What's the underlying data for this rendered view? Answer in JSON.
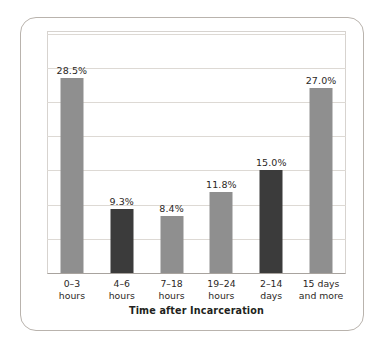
{
  "chart_data": {
    "type": "bar",
    "title": "",
    "xlabel": "Time after Incarceration",
    "ylabel": "Percentage of Inmate Suicides",
    "categories": [
      "0–3 hours",
      "4–6 hours",
      "7–18 hours",
      "19–24 hours",
      "2–14 days",
      "15 days and more"
    ],
    "category_lines": [
      {
        "line1": "0–3",
        "line2": "hours"
      },
      {
        "line1": "4–6",
        "line2": "hours"
      },
      {
        "line1": "7–18",
        "line2": "hours"
      },
      {
        "line1": "19–24",
        "line2": "hours"
      },
      {
        "line1": "2–14",
        "line2": "days"
      },
      {
        "line1": "15 days",
        "line2": "and more"
      }
    ],
    "values": [
      28.5,
      9.3,
      8.4,
      11.8,
      15.0,
      27.0
    ],
    "value_labels": [
      "28.5%",
      "9.3%",
      "8.4%",
      "11.8%",
      "15.0%",
      "27.0%"
    ],
    "bar_colors": [
      "#8f8f8f",
      "#3b3b3b",
      "#8f8f8f",
      "#8f8f8f",
      "#3b3b3b",
      "#8f8f8f"
    ],
    "bar_shades": [
      "light",
      "dark",
      "light",
      "light",
      "dark",
      "light"
    ],
    "ylim": [
      0,
      35.4
    ],
    "y_gridline_values": [
      5,
      10,
      15,
      20,
      25,
      30,
      35
    ],
    "grid": true,
    "y_tick_labels_visible": false,
    "legend": null,
    "legend_position": "none",
    "colors": {
      "bar_light": "#8f8f8f",
      "bar_dark": "#3b3b3b",
      "gridline": "#ddd9d4",
      "axis": "#a8a39e",
      "frame": "#b9b3ad",
      "text": "#231f20",
      "background": "#ffffff"
    }
  }
}
